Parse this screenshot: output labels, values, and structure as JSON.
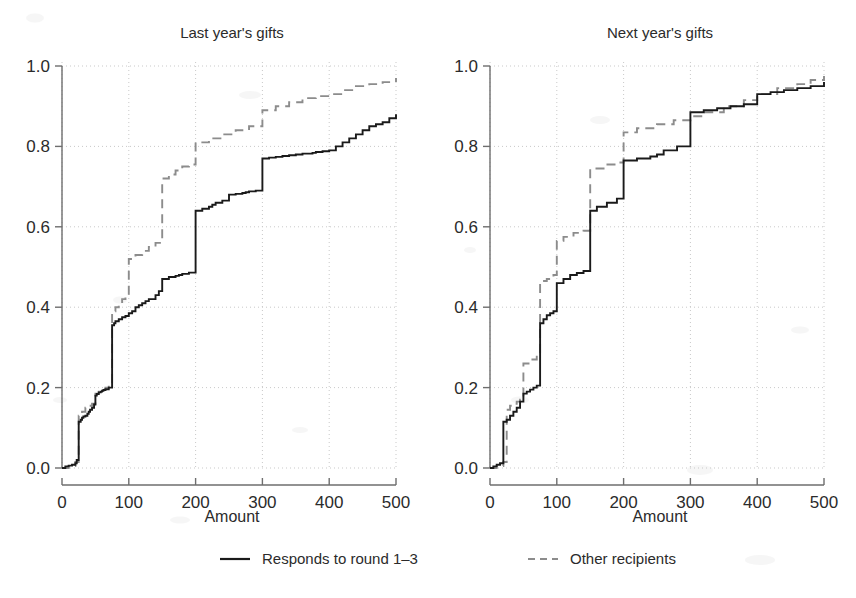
{
  "figure": {
    "background": "#ffffff",
    "ink_color": "#1a1a1a",
    "grid_color": "#c9c9c9",
    "dashed_series_color": "#8c8c8c"
  },
  "panels": [
    {
      "id": "last-year",
      "title": "Last year's gifts",
      "xlabel": "Amount"
    },
    {
      "id": "next-year",
      "title": "Next year's gifts",
      "xlabel": "Amount"
    }
  ],
  "axes": {
    "y_ticks": [
      "0.0",
      "0.2",
      "0.4",
      "0.6",
      "0.8",
      "1.0"
    ],
    "y_values": [
      0.0,
      0.2,
      0.4,
      0.6,
      0.8,
      1.0
    ],
    "x_ticks": [
      "0",
      "100",
      "200",
      "300",
      "400",
      "500"
    ],
    "x_values": [
      0,
      100,
      200,
      300,
      400,
      500
    ],
    "xlim": [
      0,
      500
    ],
    "ylim": [
      0.0,
      1.0
    ],
    "grid": true,
    "xlabel": "Amount",
    "ylabel": ""
  },
  "legend": {
    "position": "bottom-center",
    "entries": [
      {
        "label": "Responds to round 1–3",
        "style": "solid",
        "color": "#1a1a1a"
      },
      {
        "label": "Other recipients",
        "style": "dashed",
        "color": "#8c8c8c"
      }
    ]
  },
  "chart_data": {
    "type": "line",
    "subtype": "empirical-cdf-step",
    "xlabel": "Amount",
    "ylabel": "",
    "xlim": [
      0,
      500
    ],
    "ylim": [
      0.0,
      1.0
    ],
    "grid": true,
    "legend_position": "bottom-center",
    "panels": [
      {
        "title": "Last year's gifts",
        "series": [
          {
            "name": "Responds to round 1–3",
            "style": "solid",
            "x": [
              0,
              5,
              10,
              15,
              20,
              22,
              25,
              25,
              28,
              30,
              32,
              35,
              38,
              40,
              42,
              45,
              48,
              50,
              50,
              52,
              55,
              58,
              60,
              62,
              65,
              70,
              72,
              75,
              75,
              78,
              80,
              85,
              90,
              95,
              100,
              100,
              105,
              110,
              115,
              120,
              125,
              130,
              140,
              145,
              150,
              150,
              160,
              170,
              175,
              180,
              190,
              200,
              200,
              210,
              220,
              225,
              230,
              240,
              250,
              250,
              260,
              270,
              275,
              280,
              290,
              300,
              300,
              310,
              320,
              330,
              340,
              350,
              360,
              375,
              380,
              390,
              400,
              410,
              420,
              430,
              440,
              450,
              460,
              470,
              480,
              490,
              500
            ],
            "y": [
              0.0,
              0.004,
              0.006,
              0.008,
              0.012,
              0.02,
              0.02,
              0.115,
              0.12,
              0.125,
              0.128,
              0.13,
              0.135,
              0.14,
              0.145,
              0.15,
              0.158,
              0.17,
              0.18,
              0.184,
              0.188,
              0.19,
              0.192,
              0.194,
              0.196,
              0.2,
              0.2,
              0.2,
              0.355,
              0.36,
              0.365,
              0.37,
              0.375,
              0.378,
              0.38,
              0.385,
              0.39,
              0.4,
              0.405,
              0.41,
              0.415,
              0.42,
              0.43,
              0.44,
              0.45,
              0.47,
              0.475,
              0.478,
              0.48,
              0.483,
              0.486,
              0.49,
              0.64,
              0.645,
              0.65,
              0.655,
              0.66,
              0.665,
              0.67,
              0.68,
              0.682,
              0.684,
              0.686,
              0.688,
              0.69,
              0.692,
              0.77,
              0.772,
              0.774,
              0.776,
              0.778,
              0.78,
              0.782,
              0.784,
              0.786,
              0.788,
              0.79,
              0.8,
              0.81,
              0.82,
              0.83,
              0.84,
              0.85,
              0.855,
              0.86,
              0.87,
              0.88
            ],
            "note": "Large jumps occur at round amounts 25, 50, 75, 100, 200, 300, 500 reflecting donor rounding; curve reaches ~0.96 at 500."
          },
          {
            "name": "Other recipients",
            "style": "dashed",
            "x": [
              0,
              10,
              20,
              25,
              25,
              30,
              35,
              40,
              45,
              50,
              50,
              55,
              60,
              65,
              70,
              75,
              75,
              80,
              85,
              90,
              95,
              100,
              100,
              110,
              120,
              130,
              140,
              150,
              150,
              160,
              170,
              180,
              190,
              200,
              200,
              220,
              240,
              260,
              280,
              300,
              300,
              320,
              340,
              360,
              380,
              400,
              420,
              440,
              460,
              480,
              500
            ],
            "y": [
              0.0,
              0.005,
              0.015,
              0.02,
              0.13,
              0.14,
              0.15,
              0.155,
              0.16,
              0.17,
              0.185,
              0.19,
              0.195,
              0.2,
              0.205,
              0.21,
              0.39,
              0.4,
              0.41,
              0.42,
              0.43,
              0.44,
              0.52,
              0.53,
              0.54,
              0.55,
              0.56,
              0.57,
              0.72,
              0.73,
              0.74,
              0.75,
              0.755,
              0.76,
              0.81,
              0.82,
              0.83,
              0.84,
              0.85,
              0.86,
              0.89,
              0.9,
              0.91,
              0.92,
              0.925,
              0.93,
              0.94,
              0.95,
              0.955,
              0.96,
              0.97
            ],
            "note": "Dashed curve lies above the solid curve throughout, ending near 0.97 at 500."
          }
        ]
      },
      {
        "title": "Next year's gifts",
        "series": [
          {
            "name": "Responds to round 1–3",
            "style": "solid",
            "x": [
              0,
              5,
              10,
              15,
              20,
              20,
              25,
              30,
              35,
              40,
              45,
              50,
              50,
              55,
              60,
              65,
              70,
              75,
              75,
              80,
              85,
              90,
              95,
              100,
              100,
              110,
              120,
              130,
              140,
              150,
              150,
              160,
              175,
              190,
              200,
              200,
              220,
              240,
              250,
              260,
              280,
              300,
              300,
              320,
              340,
              360,
              380,
              400,
              400,
              420,
              440,
              460,
              480,
              500
            ],
            "y": [
              0.0,
              0.004,
              0.008,
              0.012,
              0.018,
              0.115,
              0.12,
              0.13,
              0.14,
              0.15,
              0.165,
              0.18,
              0.185,
              0.19,
              0.195,
              0.2,
              0.205,
              0.21,
              0.36,
              0.37,
              0.38,
              0.385,
              0.39,
              0.4,
              0.46,
              0.47,
              0.48,
              0.485,
              0.49,
              0.495,
              0.64,
              0.65,
              0.66,
              0.67,
              0.68,
              0.765,
              0.77,
              0.775,
              0.78,
              0.79,
              0.8,
              0.83,
              0.885,
              0.89,
              0.895,
              0.9,
              0.905,
              0.91,
              0.93,
              0.935,
              0.94,
              0.945,
              0.95,
              0.96
            ],
            "note": "Similar stepwise rounding pattern; large risers at 25, 50, 75, 100, 200, 300, 400."
          },
          {
            "name": "Other recipients",
            "style": "dashed",
            "x": [
              0,
              10,
              20,
              25,
              25,
              30,
              35,
              40,
              45,
              50,
              50,
              60,
              70,
              75,
              75,
              85,
              95,
              100,
              100,
              110,
              125,
              140,
              150,
              150,
              170,
              190,
              200,
              200,
              220,
              250,
              275,
              300,
              320,
              350,
              380,
              400,
              430,
              460,
              480,
              500
            ],
            "y": [
              0.0,
              0.005,
              0.015,
              0.02,
              0.145,
              0.155,
              0.16,
              0.165,
              0.17,
              0.175,
              0.26,
              0.27,
              0.28,
              0.285,
              0.465,
              0.47,
              0.48,
              0.49,
              0.565,
              0.575,
              0.585,
              0.59,
              0.6,
              0.745,
              0.755,
              0.76,
              0.765,
              0.835,
              0.845,
              0.855,
              0.865,
              0.875,
              0.885,
              0.9,
              0.915,
              0.93,
              0.945,
              0.955,
              0.965,
              0.975
            ],
            "note": "Dashed curve sits above solid curve across the full range, ending near 0.975."
          }
        ]
      }
    ]
  }
}
